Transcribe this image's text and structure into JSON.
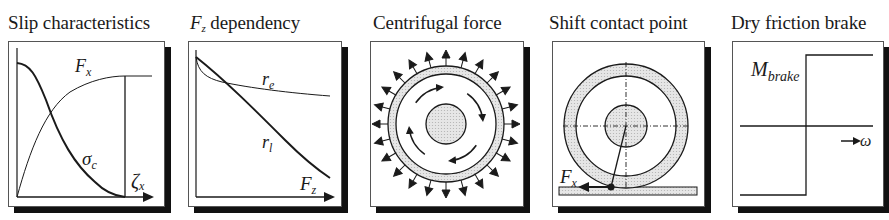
{
  "panels": [
    {
      "id": "slip",
      "title": "Slip characteristics",
      "labels": {
        "fx": "F",
        "fx_sub": "x",
        "sigma": "σ",
        "sigma_sub": "c",
        "zeta": "ζ",
        "zeta_sub": "x"
      }
    },
    {
      "id": "fz",
      "title_var": "F",
      "title_sub": "z",
      "title": "dependency",
      "labels": {
        "re": "r",
        "re_sub": "e",
        "rl": "r",
        "rl_sub": "l",
        "fz": "F",
        "fz_sub": "z"
      }
    },
    {
      "id": "centrifugal",
      "title": "Centrifugal force",
      "radial_arrow_count": 24
    },
    {
      "id": "shift",
      "title": "Shift contact point",
      "labels": {
        "fx": "F",
        "fx_sub": "x"
      }
    },
    {
      "id": "brake",
      "title": "Dry friction brake",
      "labels": {
        "m": "M",
        "m_sub": "brake",
        "omega": "ω"
      }
    }
  ],
  "colors": {
    "line": "#1a1a1a",
    "shade": "#d9d9d9",
    "shadow": "#111111",
    "frame": "#555555"
  }
}
